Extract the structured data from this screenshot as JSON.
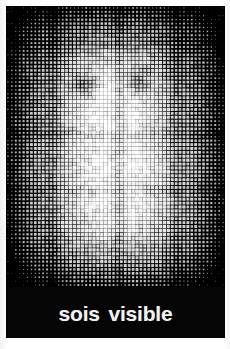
{
  "poster": {
    "width": 230,
    "height": 349,
    "background_color": "#ffffff"
  },
  "artwork": {
    "name": "halftone-dot-portrait",
    "description": "black and white halftone dot matrix image",
    "dot_color": "#ffffff",
    "background_color": "#000000",
    "grid_columns": 56,
    "grid_rows": 72,
    "cell_size_px": 3.9,
    "left": 6,
    "top": 6,
    "width": 219,
    "height": 281
  },
  "caption": {
    "text": "sois visible",
    "text_color": "#f2f2f2",
    "band_color": "#050505",
    "font_size_px": 21,
    "font_weight": "bold",
    "left": 6,
    "top": 287,
    "width": 219,
    "height": 51
  },
  "bottom_strip": {
    "color": "#ffffff",
    "top": 338,
    "height": 11
  }
}
